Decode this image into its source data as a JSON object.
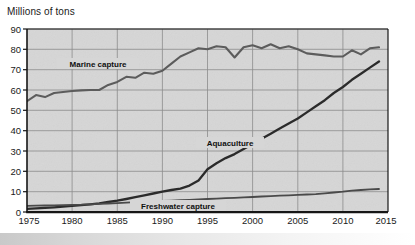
{
  "chart_data": {
    "type": "line",
    "title": "Millions of tons",
    "xlabel": "",
    "ylabel": "Millions of tons",
    "xlim": [
      1975,
      2015
    ],
    "ylim": [
      0,
      90
    ],
    "grid": true,
    "legend": "inline-labels",
    "x_ticks": [
      "1975",
      "1980",
      "1985",
      "1990",
      "1995",
      "2000",
      "2005",
      "2010",
      "2015"
    ],
    "y_ticks": [
      "0",
      "10",
      "20",
      "30",
      "40",
      "50",
      "60",
      "70",
      "80",
      "90"
    ],
    "x": [
      1975,
      1976,
      1977,
      1978,
      1979,
      1980,
      1981,
      1982,
      1983,
      1984,
      1985,
      1986,
      1987,
      1988,
      1989,
      1990,
      1991,
      1992,
      1993,
      1994,
      1995,
      1996,
      1997,
      1998,
      1999,
      2000,
      2001,
      2002,
      2003,
      2004,
      2005,
      2006,
      2007,
      2008,
      2009,
      2010,
      2011,
      2012,
      2013,
      2014
    ],
    "series": [
      {
        "name": "Marine capture",
        "label": "Marine capture",
        "color": "#5c5c5c",
        "label_x": 1983.5,
        "label_y": 71.5,
        "values": [
          54.5,
          57.5,
          56.5,
          58.5,
          59.0,
          59.5,
          59.8,
          60.0,
          60.0,
          62.5,
          64.0,
          66.5,
          66.0,
          68.5,
          68.0,
          69.5,
          73.0,
          76.5,
          78.5,
          80.5,
          80.0,
          81.5,
          81.0,
          76.0,
          81.0,
          82.0,
          80.5,
          82.5,
          80.5,
          81.5,
          80.0,
          78.0,
          77.5,
          77.0,
          76.5,
          76.5,
          79.5,
          77.5,
          80.5,
          81.0
        ]
      },
      {
        "name": "Aquaculture",
        "label": "Aquaculture",
        "color": "#2b2b2b",
        "label_x": 1997.5,
        "label_y": 36.5,
        "values": [
          1.5,
          1.8,
          2.0,
          2.3,
          2.6,
          3.0,
          3.4,
          3.8,
          4.3,
          4.9,
          5.6,
          6.4,
          7.3,
          8.2,
          9.1,
          10.0,
          10.8,
          11.5,
          13.0,
          15.5,
          21.0,
          24.0,
          26.5,
          28.5,
          31.0,
          33.5,
          36.0,
          38.5,
          41.0,
          43.5,
          46.0,
          49.0,
          52.0,
          55.0,
          58.5,
          61.5,
          65.0,
          68.0,
          71.0,
          74.0
        ]
      },
      {
        "name": "Freshwater capture",
        "label": "Freshwater capture",
        "color": "#4a4a4a",
        "label_x": 1991.5,
        "label_y": 3.8,
        "values": [
          3.0,
          3.1,
          3.2,
          3.3,
          3.4,
          3.5,
          3.6,
          3.8,
          4.0,
          4.2,
          4.4,
          4.6,
          4.8,
          5.0,
          5.2,
          5.4,
          5.6,
          5.8,
          6.0,
          6.2,
          6.4,
          6.6,
          6.8,
          7.0,
          7.2,
          7.4,
          7.6,
          7.8,
          8.0,
          8.2,
          8.4,
          8.6,
          8.8,
          9.2,
          9.6,
          10.0,
          10.5,
          10.8,
          11.1,
          11.3
        ]
      }
    ]
  },
  "colors": {
    "plot_background": "#d6d6d6",
    "grid": "#8e8e8e",
    "axis": "#1b1b1b",
    "page_background": "#ffffff"
  }
}
